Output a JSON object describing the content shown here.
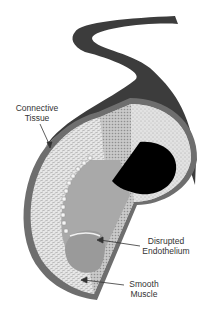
{
  "diagram": {
    "labels": {
      "connective_tissue": {
        "line1": "Connective",
        "line2": "Tissue"
      },
      "disrupted_endothelium": {
        "line1": "Disrupted",
        "line2": "Endothelium"
      },
      "smooth_muscle": {
        "line1": "Smooth",
        "line2": "Muscle"
      }
    },
    "colors": {
      "outer_band": "#3c3c3c",
      "ring_border": "#6e6e6e",
      "muscle_layer": "#d9d9d9",
      "endothelium": "#a9a9a9",
      "cut_face": "#bdbdbd",
      "lumen": "#000000",
      "text": "#333333"
    }
  }
}
